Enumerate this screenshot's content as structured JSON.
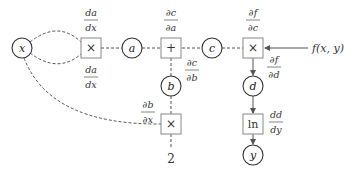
{
  "diagram": {
    "nodes": {
      "x": {
        "label": "x"
      },
      "a": {
        "label": "a"
      },
      "b": {
        "label": "b"
      },
      "c": {
        "label": "c"
      },
      "d": {
        "label": "d"
      },
      "y": {
        "label": "y"
      },
      "const": {
        "label": "2"
      }
    },
    "ops": {
      "mul1": {
        "label": "×"
      },
      "add": {
        "label": "+"
      },
      "mul2": {
        "label": "×"
      },
      "mul3": {
        "label": "×"
      },
      "ln": {
        "label": "ln"
      }
    },
    "output": {
      "label": "f(x, y)"
    },
    "derivatives": {
      "da_dx_top": {
        "num": "da",
        "den": "dx"
      },
      "da_dx_bottom": {
        "num": "da",
        "den": "dx"
      },
      "dc_da": {
        "num": "∂c",
        "den": "∂a"
      },
      "dc_db": {
        "num": "∂c",
        "den": "∂b"
      },
      "db_dx": {
        "num": "∂b",
        "den": "∂x"
      },
      "df_dc": {
        "num": "∂f",
        "den": "∂c"
      },
      "df_dd": {
        "num": "∂f",
        "den": "∂d"
      },
      "dd_dy": {
        "num": "dd",
        "den": "dy"
      }
    }
  }
}
